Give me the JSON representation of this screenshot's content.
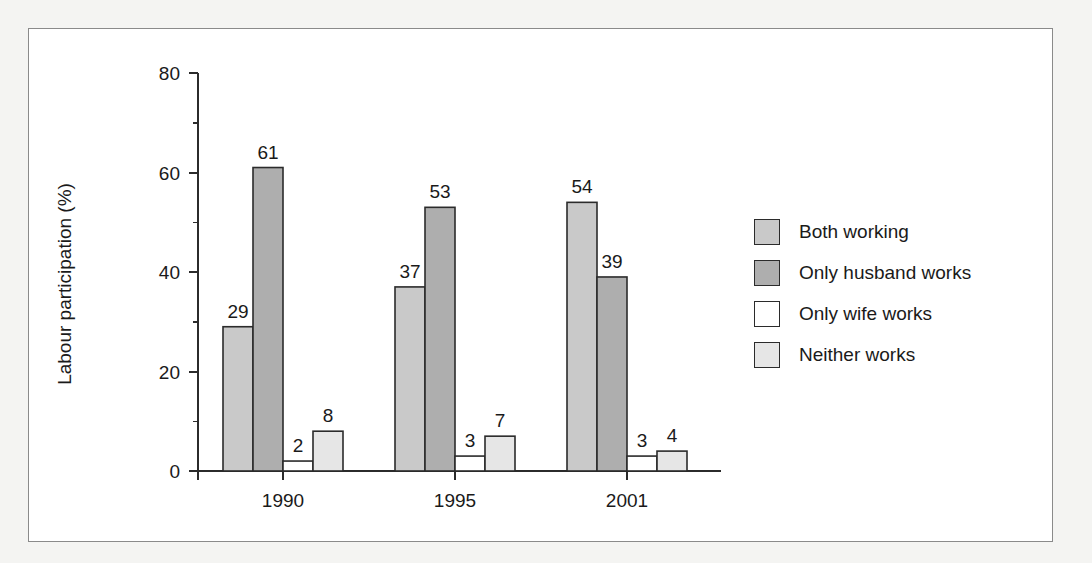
{
  "chart_data": {
    "type": "bar",
    "title": "",
    "subtitle": "",
    "xlabel": "",
    "ylabel": "Labour participation (%)",
    "categories": [
      "1990",
      "1995",
      "2001"
    ],
    "series": [
      {
        "name": "Both working",
        "values": [
          29,
          37,
          54
        ],
        "color": "#c9c9c9"
      },
      {
        "name": "Only husband works",
        "values": [
          61,
          53,
          39
        ],
        "color": "#aeaeae"
      },
      {
        "name": "Only wife works",
        "values": [
          2,
          3,
          3
        ],
        "color": "#ffffff"
      },
      {
        "name": "Neither works",
        "values": [
          8,
          7,
          4
        ],
        "color": "#e6e6e6"
      }
    ],
    "ylim": [
      0,
      80
    ],
    "y_major_ticks": [
      0,
      20,
      40,
      60,
      80
    ],
    "y_minor_ticks": [
      10,
      30,
      50,
      70
    ],
    "y_tick_labels": [
      "0",
      "20",
      "40",
      "60",
      "80"
    ],
    "grid": false,
    "show_value_labels": true,
    "legend_position": "right"
  },
  "legend": {
    "items": [
      {
        "label": "Both working",
        "swatch": "#c9c9c9"
      },
      {
        "label": "Only husband works",
        "swatch": "#aeaeae"
      },
      {
        "label": "Only wife works",
        "swatch": "#ffffff"
      },
      {
        "label": "Neither works",
        "swatch": "#e6e6e6"
      }
    ]
  }
}
